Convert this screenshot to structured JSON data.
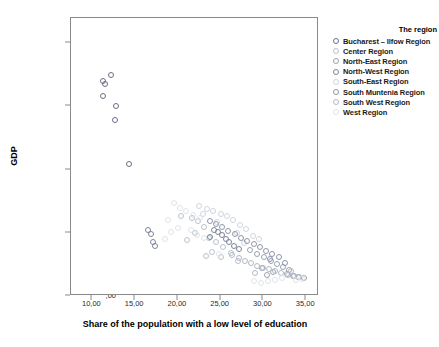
{
  "chart_data": {
    "type": "scatter",
    "title": "",
    "xlabel": "Share of the population with a low level of education",
    "ylabel": "GDP",
    "xlim": [
      7.5,
      36.5
    ],
    "ylim": [
      0,
      22000
    ],
    "xticks": [
      10,
      15,
      20,
      25,
      30,
      35
    ],
    "xticklabels": [
      "10,00",
      "15,00",
      "20,00",
      "25,00",
      "30,00",
      "35,00"
    ],
    "yticks": [
      0,
      5000,
      10000,
      15000,
      20000
    ],
    "yticklabels": [
      ",00",
      "5000,00",
      "10000,00",
      "15000,00",
      "20000,00"
    ],
    "grid": false,
    "legend_title": "The region",
    "legend_position": "right",
    "series": [
      {
        "name": "Bucharest – Ilfow Region",
        "color": "#6b6f86",
        "points": [
          [
            11.3,
            17050
          ],
          [
            11.5,
            16750
          ],
          [
            12.2,
            17450
          ],
          [
            11.2,
            15800
          ],
          [
            12.8,
            15050
          ],
          [
            12.6,
            13950
          ],
          [
            14.3,
            10450
          ]
        ]
      },
      {
        "name": "Center Region",
        "color": "#b9c2cd",
        "points": [
          [
            20.4,
            6350
          ],
          [
            21.6,
            6150
          ],
          [
            22.3,
            5900
          ],
          [
            23.1,
            5500
          ],
          [
            22.0,
            4950
          ],
          [
            23.6,
            4600
          ],
          [
            24.4,
            4250
          ],
          [
            21.1,
            4400
          ],
          [
            25.3,
            3850
          ],
          [
            24.0,
            3500
          ],
          [
            26.2,
            3400
          ],
          [
            25.0,
            3050
          ],
          [
            23.3,
            3150
          ],
          [
            27.0,
            2800
          ]
        ]
      },
      {
        "name": "North-East Region",
        "color": "#9aa3b2",
        "points": [
          [
            28.4,
            3650
          ],
          [
            29.2,
            3300
          ],
          [
            30.1,
            3050
          ],
          [
            30.9,
            2750
          ],
          [
            31.6,
            2500
          ],
          [
            32.3,
            2300
          ],
          [
            33.0,
            2050
          ],
          [
            29.8,
            2200
          ],
          [
            31.1,
            1900
          ],
          [
            32.8,
            1750
          ],
          [
            33.6,
            1600
          ],
          [
            34.2,
            1500
          ],
          [
            30.4,
            1700
          ],
          [
            34.8,
            1400
          ]
        ]
      },
      {
        "name": "North-West Region",
        "color": "#7e8598",
        "points": [
          [
            16.5,
            5250
          ],
          [
            16.9,
            4900
          ],
          [
            17.1,
            4250
          ],
          [
            17.3,
            3950
          ],
          [
            24.2,
            5200
          ],
          [
            24.7,
            5050
          ],
          [
            25.1,
            4800
          ],
          [
            25.6,
            4550
          ],
          [
            26.0,
            4300
          ],
          [
            23.8,
            4700
          ],
          [
            26.6,
            3950
          ],
          [
            27.2,
            3700
          ]
        ]
      },
      {
        "name": "South-East Region",
        "color": "#cfd6de",
        "points": [
          [
            22.5,
            7150
          ],
          [
            23.4,
            6900
          ],
          [
            24.1,
            6700
          ],
          [
            25.0,
            6500
          ],
          [
            25.8,
            6300
          ],
          [
            26.5,
            6050
          ],
          [
            24.6,
            5850
          ],
          [
            27.3,
            5600
          ],
          [
            22.9,
            6450
          ],
          [
            28.0,
            5300
          ],
          [
            26.9,
            5000
          ],
          [
            28.8,
            4750
          ],
          [
            29.5,
            4500
          ],
          [
            27.7,
            4200
          ]
        ]
      },
      {
        "name": "South Muntenia Region",
        "color": "#8f96a8",
        "points": [
          [
            24.4,
            5700
          ],
          [
            25.2,
            5450
          ],
          [
            25.9,
            5150
          ],
          [
            26.7,
            4900
          ],
          [
            27.4,
            4600
          ],
          [
            28.1,
            4350
          ],
          [
            23.8,
            5950
          ],
          [
            28.9,
            4100
          ],
          [
            29.6,
            3850
          ],
          [
            30.3,
            3600
          ],
          [
            31.0,
            3350
          ],
          [
            31.8,
            3100
          ],
          [
            30.8,
            2900
          ],
          [
            32.5,
            2650
          ]
        ]
      },
      {
        "name": "South  West Region",
        "color": "#b3bac6",
        "points": [
          [
            26.3,
            3250
          ],
          [
            27.1,
            3000
          ],
          [
            27.9,
            2800
          ],
          [
            28.6,
            2600
          ],
          [
            29.3,
            2400
          ],
          [
            30.0,
            2250
          ],
          [
            30.7,
            2100
          ],
          [
            31.4,
            1950
          ],
          [
            32.1,
            1800
          ],
          [
            32.9,
            1700
          ],
          [
            33.5,
            1600
          ],
          [
            34.1,
            1500
          ],
          [
            29.0,
            1850
          ],
          [
            33.2,
            2000
          ]
        ]
      },
      {
        "name": "West Region",
        "color": "#dfe4ea",
        "points": [
          [
            19.6,
            7350
          ],
          [
            20.3,
            7000
          ],
          [
            21.0,
            6700
          ],
          [
            21.8,
            6400
          ],
          [
            22.6,
            6150
          ],
          [
            18.9,
            6000
          ],
          [
            20.0,
            5400
          ],
          [
            19.2,
            5050
          ],
          [
            21.5,
            5200
          ],
          [
            22.2,
            4850
          ],
          [
            23.0,
            4600
          ],
          [
            18.5,
            4500
          ],
          [
            24.8,
            3300
          ],
          [
            33.8,
            1250
          ],
          [
            34.5,
            1350
          ],
          [
            32.2,
            1450
          ],
          [
            31.3,
            1250
          ],
          [
            30.5,
            1150
          ],
          [
            29.7,
            1050
          ],
          [
            28.9,
            1200
          ]
        ]
      }
    ]
  }
}
